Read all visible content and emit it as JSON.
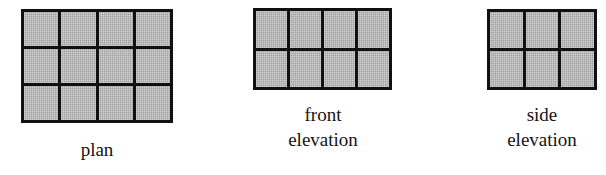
{
  "document": {
    "background_color": "#ffffff",
    "ink_color": "#111111",
    "cell_fill_color": "#a9a9a9",
    "caption_color": "#141414"
  },
  "figures": [
    {
      "id": "plan",
      "name": "plan-figure",
      "caption_lines": [
        "plan"
      ],
      "grid": {
        "columns": 4,
        "rows": 3,
        "cells": 12
      }
    },
    {
      "id": "front-elevation",
      "name": "front-elevation-figure",
      "caption_lines": [
        "front",
        "elevation"
      ],
      "grid": {
        "columns": 4,
        "rows": 2,
        "cells": 8
      }
    },
    {
      "id": "side-elevation",
      "name": "side-elevation-figure",
      "caption_lines": [
        "side",
        "elevation"
      ],
      "grid": {
        "columns": 3,
        "rows": 2,
        "cells": 6
      }
    }
  ]
}
